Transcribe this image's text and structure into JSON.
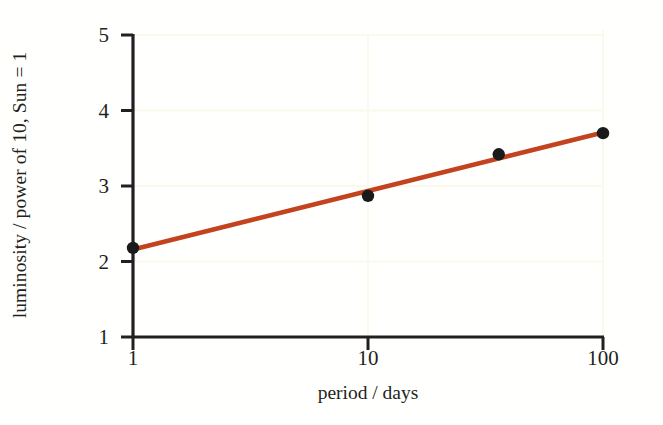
{
  "chart_data": {
    "type": "line",
    "title": "",
    "subtitle": "",
    "xlabel": "period / days",
    "ylabel": "luminosity / power of 10, Sun = 1",
    "xscale": "log",
    "yscale": "linear",
    "xlim": [
      1,
      100
    ],
    "ylim": [
      1,
      5
    ],
    "xticks": [
      1,
      10,
      100
    ],
    "xticklabels": [
      "1",
      "10",
      "100"
    ],
    "yticks": [
      1,
      2,
      3,
      4,
      5
    ],
    "yticklabels": [
      "1",
      "2",
      "3",
      "4",
      "5"
    ],
    "grid": "faint",
    "grid_color": "#fafaf0",
    "legend": "none",
    "series": [
      {
        "name": "measured Cepheids",
        "type": "scatter",
        "marker": "filled-circle",
        "color": "#1a1a1a",
        "points": [
          {
            "x": 1,
            "y": 2.18
          },
          {
            "x": 10,
            "y": 2.87
          },
          {
            "x": 36,
            "y": 3.42
          },
          {
            "x": 100,
            "y": 3.7
          }
        ]
      },
      {
        "name": "best-fit line",
        "type": "line",
        "color": "#c3431f",
        "linewidth": 4,
        "points": [
          {
            "x": 1,
            "y": 2.16
          },
          {
            "x": 100,
            "y": 3.71
          }
        ]
      }
    ]
  },
  "axis_labels": {
    "x_title": "period / days",
    "y_title": "luminosity / power of 10, Sun = 1"
  },
  "colors": {
    "fit_line": "#c3431f",
    "marker": "#1a1a1a",
    "axis": "#231f20",
    "gridline": "#fafaf0",
    "background": "#ffffff"
  }
}
